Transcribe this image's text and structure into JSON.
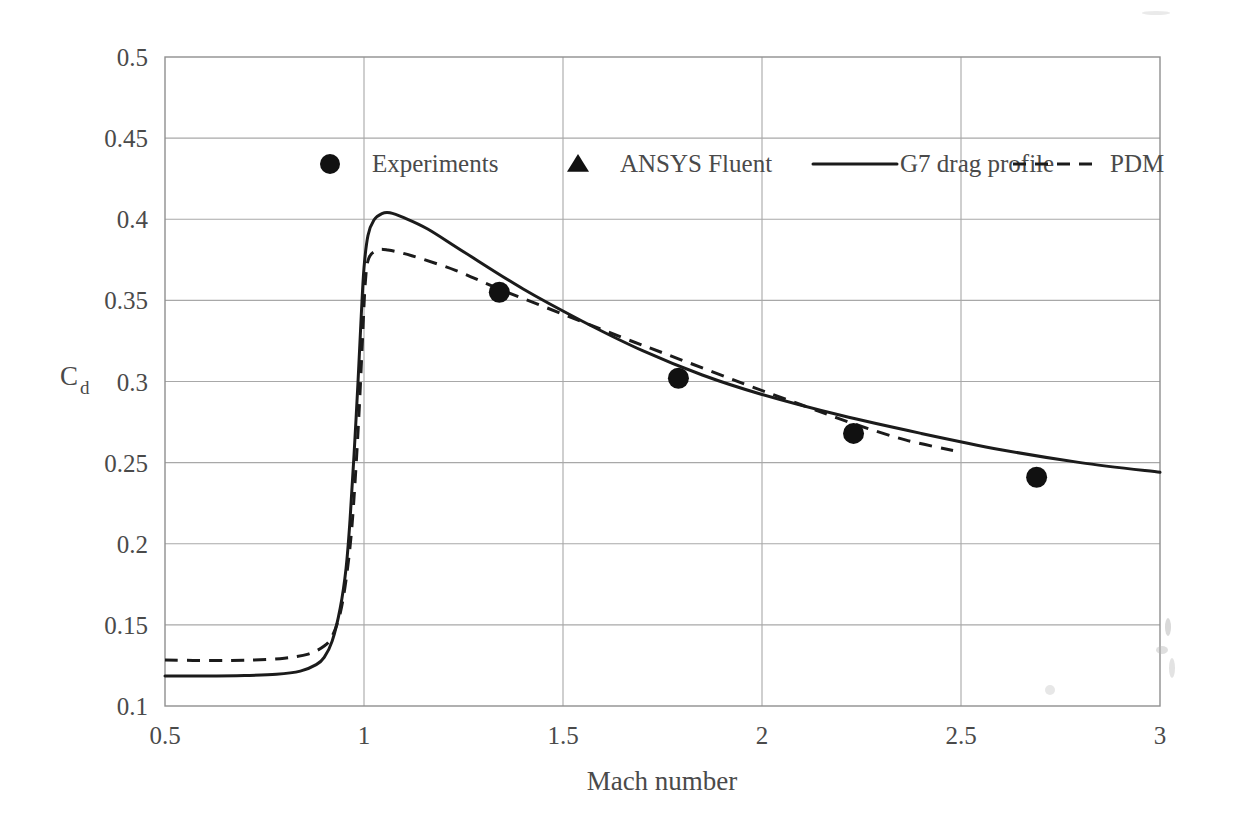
{
  "figure": {
    "background": "#ffffff",
    "ink_color": "#1b1b1b",
    "grid_color": "#a8a8a8",
    "text_color": "#4a4a4a"
  },
  "axes": {
    "x_title": "Mach number",
    "y_title_main": "C",
    "y_title_sub": "d",
    "x_ticks": [
      "0.5",
      "1",
      "1.5",
      "2",
      "2.5",
      "3"
    ],
    "y_ticks": [
      "0.1",
      "0.15",
      "0.2",
      "0.25",
      "0.3",
      "0.35",
      "0.4",
      "0.45",
      "0.5"
    ]
  },
  "legend": {
    "position": "inside-top",
    "items": [
      {
        "label": "Experiments",
        "marker": "filled-circle-marker",
        "kind": "marker"
      },
      {
        "label": "ANSYS Fluent",
        "marker": "filled-triangle-marker",
        "kind": "marker"
      },
      {
        "label": "G7 drag profile",
        "marker": "solid-line-swatch",
        "kind": "line"
      },
      {
        "label": "PDM",
        "marker": "dashed-line-swatch",
        "kind": "line"
      }
    ]
  },
  "chart_data": {
    "type": "scatter",
    "title": "",
    "xlabel": "Mach number",
    "ylabel": "Cd",
    "xlim": [
      0.5,
      3.0
    ],
    "ylim": [
      0.1,
      0.5
    ],
    "xtick_step": 0.5,
    "ytick_step": 0.05,
    "grid": true,
    "legend_position": "inside-top",
    "series": [
      {
        "name": "Experiments",
        "type": "scatter",
        "marker": "circle",
        "points": [
          {
            "x": 1.34,
            "y": 0.355
          },
          {
            "x": 1.79,
            "y": 0.302
          },
          {
            "x": 2.23,
            "y": 0.268
          },
          {
            "x": 2.69,
            "y": 0.241
          }
        ]
      },
      {
        "name": "ANSYS Fluent",
        "type": "scatter",
        "marker": "triangle",
        "points": [
          {
            "x": 0.5,
            "y": 0.14
          },
          {
            "x": 0.61,
            "y": 0.137
          },
          {
            "x": 0.76,
            "y": 0.136
          },
          {
            "x": 0.91,
            "y": 0.144
          },
          {
            "x": 0.93,
            "y": 0.152
          },
          {
            "x": 0.95,
            "y": 0.174
          },
          {
            "x": 0.97,
            "y": 0.203
          },
          {
            "x": 0.985,
            "y": 0.249
          },
          {
            "x": 0.995,
            "y": 0.286
          },
          {
            "x": 1.0,
            "y": 0.324
          },
          {
            "x": 1.005,
            "y": 0.367
          },
          {
            "x": 1.06,
            "y": 0.38
          },
          {
            "x": 1.12,
            "y": 0.377
          },
          {
            "x": 1.23,
            "y": 0.368
          },
          {
            "x": 1.34,
            "y": 0.357
          },
          {
            "x": 1.79,
            "y": 0.311
          },
          {
            "x": 2.23,
            "y": 0.272
          },
          {
            "x": 2.69,
            "y": 0.242
          }
        ]
      },
      {
        "name": "G7 drag profile",
        "type": "line",
        "style": "solid",
        "points": [
          {
            "x": 0.5,
            "y": 0.1185
          },
          {
            "x": 0.6,
            "y": 0.1185
          },
          {
            "x": 0.7,
            "y": 0.1188
          },
          {
            "x": 0.78,
            "y": 0.1195
          },
          {
            "x": 0.84,
            "y": 0.1215
          },
          {
            "x": 0.88,
            "y": 0.1255
          },
          {
            "x": 0.9,
            "y": 0.13
          },
          {
            "x": 0.92,
            "y": 0.14
          },
          {
            "x": 0.94,
            "y": 0.16
          },
          {
            "x": 0.955,
            "y": 0.185
          },
          {
            "x": 0.965,
            "y": 0.215
          },
          {
            "x": 0.975,
            "y": 0.255
          },
          {
            "x": 0.985,
            "y": 0.3
          },
          {
            "x": 0.993,
            "y": 0.34
          },
          {
            "x": 1.0,
            "y": 0.37
          },
          {
            "x": 1.01,
            "y": 0.39
          },
          {
            "x": 1.025,
            "y": 0.3995
          },
          {
            "x": 1.045,
            "y": 0.4035
          },
          {
            "x": 1.065,
            "y": 0.404
          },
          {
            "x": 1.1,
            "y": 0.401
          },
          {
            "x": 1.16,
            "y": 0.394
          },
          {
            "x": 1.25,
            "y": 0.38
          },
          {
            "x": 1.4,
            "y": 0.357
          },
          {
            "x": 1.55,
            "y": 0.337
          },
          {
            "x": 1.7,
            "y": 0.319
          },
          {
            "x": 1.85,
            "y": 0.304
          },
          {
            "x": 2.0,
            "y": 0.292
          },
          {
            "x": 2.2,
            "y": 0.279
          },
          {
            "x": 2.4,
            "y": 0.268
          },
          {
            "x": 2.6,
            "y": 0.258
          },
          {
            "x": 2.8,
            "y": 0.25
          },
          {
            "x": 3.0,
            "y": 0.244
          }
        ]
      },
      {
        "name": "PDM",
        "type": "line",
        "style": "dashed",
        "points": [
          {
            "x": 0.5,
            "y": 0.1283
          },
          {
            "x": 0.62,
            "y": 0.128
          },
          {
            "x": 0.72,
            "y": 0.1283
          },
          {
            "x": 0.8,
            "y": 0.1295
          },
          {
            "x": 0.86,
            "y": 0.132
          },
          {
            "x": 0.9,
            "y": 0.137
          },
          {
            "x": 0.92,
            "y": 0.143
          },
          {
            "x": 0.94,
            "y": 0.157
          },
          {
            "x": 0.955,
            "y": 0.178
          },
          {
            "x": 0.968,
            "y": 0.206
          },
          {
            "x": 0.978,
            "y": 0.24
          },
          {
            "x": 0.988,
            "y": 0.283
          },
          {
            "x": 0.996,
            "y": 0.325
          },
          {
            "x": 1.003,
            "y": 0.36
          },
          {
            "x": 1.012,
            "y": 0.376
          },
          {
            "x": 1.035,
            "y": 0.381
          },
          {
            "x": 1.06,
            "y": 0.381
          },
          {
            "x": 1.12,
            "y": 0.3775
          },
          {
            "x": 1.23,
            "y": 0.3685
          },
          {
            "x": 1.34,
            "y": 0.357
          },
          {
            "x": 1.5,
            "y": 0.3415
          },
          {
            "x": 1.65,
            "y": 0.327
          },
          {
            "x": 1.79,
            "y": 0.314
          },
          {
            "x": 1.95,
            "y": 0.299
          },
          {
            "x": 2.1,
            "y": 0.2855
          },
          {
            "x": 2.23,
            "y": 0.274
          },
          {
            "x": 2.36,
            "y": 0.264
          },
          {
            "x": 2.48,
            "y": 0.2575
          }
        ]
      }
    ]
  }
}
